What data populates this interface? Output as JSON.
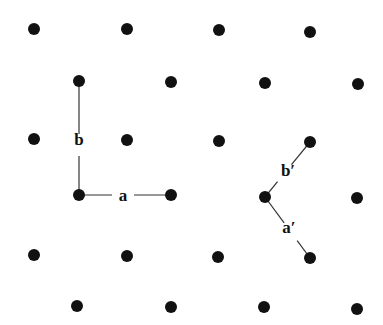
{
  "diagram": {
    "dot_color": "#111111",
    "line_color": "#333333",
    "dot_radius": 6,
    "lattice_points": [
      [
        34,
        29
      ],
      [
        127,
        29
      ],
      [
        219,
        30
      ],
      [
        310,
        32
      ],
      [
        79,
        81
      ],
      [
        171,
        82
      ],
      [
        265,
        83
      ],
      [
        358,
        84
      ],
      [
        34,
        139
      ],
      [
        127,
        140
      ],
      [
        219,
        141
      ],
      [
        310,
        142
      ],
      [
        79,
        195
      ],
      [
        171,
        195
      ],
      [
        265,
        197
      ],
      [
        357,
        198
      ],
      [
        34,
        255
      ],
      [
        127,
        256
      ],
      [
        218,
        257
      ],
      [
        310,
        258
      ],
      [
        77,
        306
      ],
      [
        171,
        307
      ],
      [
        264,
        307
      ],
      [
        357,
        309
      ]
    ],
    "vectors": [
      {
        "name": "b",
        "label": "b",
        "from": [
          79,
          195
        ],
        "to": [
          79,
          81
        ],
        "label_pos": [
          79,
          145
        ]
      },
      {
        "name": "a",
        "label": "a",
        "from": [
          79,
          195
        ],
        "to": [
          171,
          195
        ],
        "label_pos": [
          123,
          201
        ]
      },
      {
        "name": "b-prime",
        "label": "b′",
        "from": [
          265,
          197
        ],
        "to": [
          310,
          142
        ],
        "label_pos": [
          288,
          176
        ]
      },
      {
        "name": "a-prime",
        "label": "a′",
        "from": [
          265,
          197
        ],
        "to": [
          310,
          258
        ],
        "label_pos": [
          289,
          233
        ]
      }
    ]
  }
}
